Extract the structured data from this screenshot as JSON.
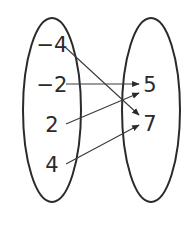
{
  "diagram": {
    "type": "mapping-diagram",
    "domain_set": {
      "values": [
        "−4",
        "−2",
        "2",
        "4"
      ]
    },
    "range_set": {
      "values": [
        "5",
        "7"
      ]
    },
    "mappings": [
      {
        "from": "−4",
        "to": "7"
      },
      {
        "from": "−2",
        "to": "5"
      },
      {
        "from": "2",
        "to": "5"
      },
      {
        "from": "4",
        "to": "7"
      }
    ],
    "colors": {
      "stroke": "#2a2a2a",
      "background": "#ffffff"
    }
  }
}
